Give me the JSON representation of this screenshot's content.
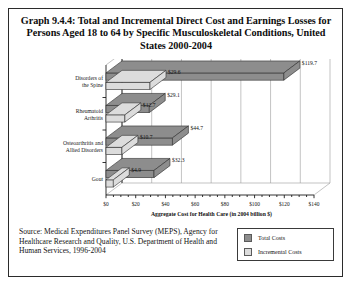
{
  "figure": {
    "title": "Graph 9.4.4: Total and Incremental Direct Cost and Earnings Losses for Persons Aged 18 to 64 by Specific Musculoskeletal Conditions, United States 2000-2004",
    "source_note": "Source: Medical Expenditures Panel Survey (MEPS), Agency for Healthcare Research and Quality, U.S. Department of Health and Human Services, 1996-2004"
  },
  "legend": {
    "position": "bottom-right",
    "items": [
      {
        "label": "Total Costs",
        "color": "#8d8d8d"
      },
      {
        "label": "Incremental Costs",
        "color": "#dcdcdc"
      }
    ]
  },
  "chart_data": {
    "type": "bar",
    "orientation": "horizontal",
    "title": "Graph 9.4.4: Total and Incremental Direct Cost and Earnings Losses for Persons Aged 18 to 64 by Specific Musculoskeletal Conditions, United States 2000-2004",
    "xlabel": "Aggregate Cost for Health Care (in 2004 billion $)",
    "ylabel": "",
    "xlim": [
      0,
      140
    ],
    "xticks": [
      0,
      20,
      40,
      60,
      80,
      100,
      120,
      140
    ],
    "xticklabels": [
      "$0",
      "$20",
      "$40",
      "$60",
      "$80",
      "$100",
      "$120",
      "$140"
    ],
    "grid": true,
    "categories": [
      "Disorders of the Spine",
      "Rheumatoid Arthritis",
      "Osteoarthritis and Allied Disorders",
      "Gout"
    ],
    "category_lines": [
      [
        "Disorders of",
        "the Spine"
      ],
      [
        "Rheumatoid",
        "Arthritis"
      ],
      [
        "Osteoarthritis and",
        "Allied Disorders"
      ],
      [
        "Gout",
        ""
      ]
    ],
    "series": [
      {
        "name": "Total Costs",
        "color": "#8d8d8d",
        "values": [
          119.7,
          29.1,
          44.7,
          32.3
        ],
        "labels": [
          "$119.7",
          "$29.1",
          "$44.7",
          "$32.3"
        ]
      },
      {
        "name": "Incremental Costs",
        "color": "#dcdcdc",
        "values": [
          29.6,
          12.7,
          10.7,
          4.9
        ],
        "labels": [
          "$29.6",
          "$12.7",
          "$10.7",
          "$4.9"
        ]
      }
    ]
  }
}
